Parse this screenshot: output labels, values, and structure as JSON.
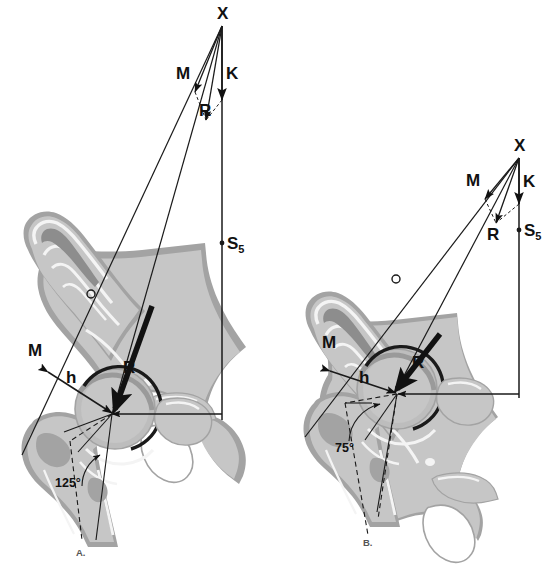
{
  "figure": {
    "background_color": "#ffffff",
    "ink_color": "#111111",
    "bone_fill": "#c6c6c6",
    "bone_shadow": "#a3a3a3",
    "bone_dark": "#8d8d8d",
    "cortical_white": "#f4f4f4",
    "head_fill": "#b8b8b8"
  },
  "panels": [
    {
      "id": "A",
      "caption": "A.",
      "neck_shaft_angle": "125°",
      "labels": {
        "apex": "X",
        "muscle_force_vector": "M",
        "body_weight_vector": "K",
        "resultant_vector": "R",
        "sacral_point": "S",
        "sacral_point_sub": "5",
        "muscle_line": "M",
        "lever_arm": "h"
      }
    },
    {
      "id": "B",
      "caption": "B.",
      "neck_shaft_angle": "75°",
      "labels": {
        "apex": "X",
        "muscle_force_vector": "M",
        "body_weight_vector": "K",
        "resultant_vector": "R",
        "sacral_point": "S",
        "sacral_point_sub": "5",
        "muscle_line": "M",
        "lever_arm": "h"
      }
    }
  ],
  "legend_terms": {
    "X": "Apex / intersection point of force lines",
    "M": "Abductor muscle force",
    "K": "Body weight force",
    "R": "Resultant joint reaction force",
    "S5": "Fifth sacral vertebra reference point",
    "h": "Lever arm distance"
  }
}
